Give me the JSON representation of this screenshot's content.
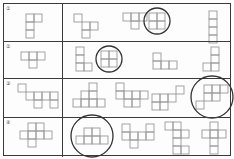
{
  "worksheet": {
    "title": "Cube net worksheet",
    "cell": 8,
    "rows": [
      {
        "label": "①",
        "top": 0,
        "height": 37,
        "given": {
          "x": 22,
          "y": 10,
          "squares": [
            [
              0,
              0
            ],
            [
              1,
              0
            ],
            [
              0,
              1
            ],
            [
              0,
              2
            ]
          ]
        },
        "options": [
          {
            "x": 70,
            "y": 10,
            "circled": false,
            "squares": [
              [
                0,
                0
              ],
              [
                1,
                1
              ],
              [
                2,
                1
              ],
              [
                1,
                2
              ]
            ]
          },
          {
            "x": 119,
            "y": 9,
            "circled": false,
            "squares": [
              [
                0,
                0
              ],
              [
                1,
                0
              ],
              [
                2,
                0
              ],
              [
                1,
                1
              ]
            ]
          },
          {
            "x": 145,
            "y": 9,
            "circled": true,
            "squares": [
              [
                0,
                0
              ],
              [
                1,
                0
              ],
              [
                0,
                1
              ],
              [
                1,
                1
              ]
            ]
          },
          {
            "x": 205,
            "y": 7,
            "circled": false,
            "squares": [
              [
                0,
                0
              ],
              [
                0,
                1
              ],
              [
                0,
                2
              ],
              [
                0,
                3
              ]
            ]
          }
        ]
      },
      {
        "label": "②",
        "top": 37,
        "height": 37,
        "given": {
          "x": 17,
          "y": 10,
          "squares": [
            [
              0,
              0
            ],
            [
              1,
              0
            ],
            [
              2,
              0
            ],
            [
              1,
              1
            ]
          ]
        },
        "options": [
          {
            "x": 72,
            "y": 5,
            "circled": false,
            "squares": [
              [
                0,
                0
              ],
              [
                0,
                1
              ],
              [
                0,
                2
              ],
              [
                1,
                2
              ]
            ]
          },
          {
            "x": 97,
            "y": 9,
            "circled": true,
            "squares": [
              [
                0,
                0
              ],
              [
                1,
                0
              ],
              [
                0,
                1
              ],
              [
                1,
                1
              ]
            ]
          },
          {
            "x": 149,
            "y": 11,
            "circled": false,
            "squares": [
              [
                0,
                0
              ],
              [
                0,
                1
              ],
              [
                1,
                1
              ],
              [
                2,
                1
              ]
            ]
          },
          {
            "x": 199,
            "y": 5,
            "circled": false,
            "squares": [
              [
                1,
                0
              ],
              [
                1,
                1
              ],
              [
                0,
                2
              ],
              [
                1,
                2
              ]
            ]
          }
        ]
      },
      {
        "label": "③",
        "top": 74,
        "height": 39,
        "given": {
          "x": 14,
          "y": 5,
          "squares": [
            [
              0,
              0
            ],
            [
              1,
              1
            ],
            [
              2,
              1
            ],
            [
              3,
              1
            ],
            [
              4,
              1
            ],
            [
              2,
              2
            ],
            [
              4,
              2
            ]
          ]
        },
        "options": [
          {
            "x": 69,
            "y": 4,
            "circled": false,
            "squares": [
              [
                2,
                0
              ],
              [
                2,
                1
              ],
              [
                1,
                1
              ],
              [
                0,
                2
              ],
              [
                1,
                2
              ],
              [
                2,
                2
              ],
              [
                3,
                2
              ]
            ]
          },
          {
            "x": 112,
            "y": 4,
            "circled": false,
            "squares": [
              [
                0,
                0
              ],
              [
                0,
                1
              ],
              [
                1,
                1
              ],
              [
                2,
                1
              ],
              [
                3,
                1
              ],
              [
                1,
                2
              ],
              [
                2,
                2
              ]
            ]
          },
          {
            "x": 148,
            "y": 7,
            "circled": false,
            "squares": [
              [
                3,
                0
              ],
              [
                2,
                1
              ],
              [
                0,
                1
              ],
              [
                1,
                1
              ],
              [
                0,
                2
              ],
              [
                1,
                2
              ]
            ]
          },
          {
            "x": 192,
            "y": 6,
            "circled": true,
            "squares": [
              [
                0,
                2
              ],
              [
                1,
                0
              ],
              [
                2,
                0
              ],
              [
                1,
                1
              ],
              [
                2,
                1
              ],
              [
                3,
                0
              ]
            ]
          }
        ]
      },
      {
        "label": "④",
        "top": 113,
        "height": 40,
        "given": {
          "x": 16,
          "y": 5,
          "squares": [
            [
              0,
              1
            ],
            [
              1,
              0
            ],
            [
              1,
              1
            ],
            [
              2,
              0
            ],
            [
              2,
              1
            ],
            [
              3,
              1
            ],
            [
              1,
              2
            ]
          ]
        },
        "options": [
          {
            "x": 72,
            "y": 10,
            "circled": true,
            "squares": [
              [
                0,
                1
              ],
              [
                1,
                0
              ],
              [
                1,
                1
              ],
              [
                2,
                0
              ],
              [
                2,
                1
              ],
              [
                3,
                1
              ]
            ]
          },
          {
            "x": 118,
            "y": 6,
            "circled": false,
            "squares": [
              [
                0,
                0
              ],
              [
                0,
                1
              ],
              [
                1,
                1
              ],
              [
                3,
                0
              ],
              [
                3,
                1
              ],
              [
                2,
                1
              ],
              [
                1,
                2
              ]
            ]
          },
          {
            "x": 161,
            "y": 4,
            "circled": false,
            "squares": [
              [
                0,
                0
              ],
              [
                1,
                0
              ],
              [
                1,
                1
              ],
              [
                2,
                1
              ],
              [
                1,
                2
              ],
              [
                1,
                3
              ],
              [
                2,
                3
              ]
            ]
          },
          {
            "x": 198,
            "y": 4,
            "circled": false,
            "squares": [
              [
                1,
                0
              ],
              [
                0,
                1
              ],
              [
                1,
                1
              ],
              [
                2,
                1
              ],
              [
                1,
                2
              ],
              [
                1,
                3
              ]
            ]
          }
        ]
      }
    ]
  }
}
